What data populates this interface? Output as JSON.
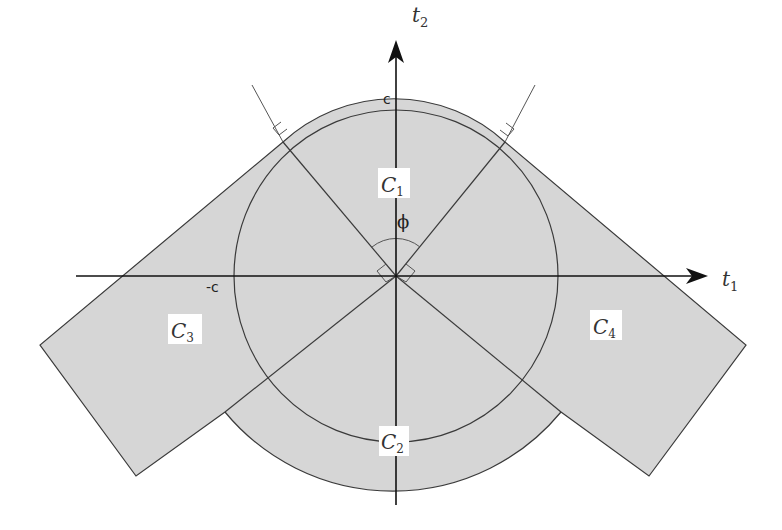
{
  "diagram": {
    "type": "geometric-regions",
    "axes": {
      "horizontal_label": "t",
      "horizontal_sub": "1",
      "vertical_label": "t",
      "vertical_sub": "2"
    },
    "ticks": {
      "top": "c",
      "left": "-c"
    },
    "angle_label": "ϕ",
    "regions": [
      {
        "id": "C1",
        "label": "C",
        "sub": "1"
      },
      {
        "id": "C2",
        "label": "C",
        "sub": "2"
      },
      {
        "id": "C3",
        "label": "C",
        "sub": "3"
      },
      {
        "id": "C4",
        "label": "C",
        "sub": "4"
      }
    ],
    "colors": {
      "fill": "#d6d6d6",
      "stroke": "#3a3a3a",
      "axis": "#111111",
      "label_bg": "#ffffff"
    }
  }
}
